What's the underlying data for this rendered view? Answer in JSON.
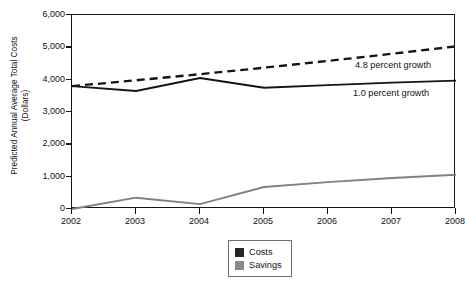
{
  "chart_data": {
    "type": "line",
    "title": "",
    "xlabel": "",
    "ylabel": "Predicted Annual Average Total Costs (Dollars)",
    "ylabel_line1": "Predicted Annual Average Total Costs",
    "ylabel_line2": "(Dollars)",
    "x": [
      2002,
      2003,
      2004,
      2005,
      2006,
      2007,
      2008
    ],
    "categories": [
      "2002",
      "2003",
      "2004",
      "2005",
      "2006",
      "2007",
      "2008"
    ],
    "xlim": [
      2002,
      2008
    ],
    "ylim": [
      0,
      6000
    ],
    "yticks": [
      0,
      1000,
      2000,
      3000,
      4000,
      5000,
      6000
    ],
    "ytick_labels": [
      "0",
      "1,000",
      "2,000",
      "3,000",
      "4,000",
      "5,000",
      "6,000"
    ],
    "grid": false,
    "legend_position": "bottom-center",
    "series": [
      {
        "name": "Costs",
        "style": "solid",
        "color": "#141414",
        "values": [
          3800,
          3650,
          4050,
          3750,
          3830,
          3910,
          3970
        ]
      },
      {
        "name": "Projected costs at 4.8 percent growth",
        "style": "dashed",
        "color": "#141414",
        "values": [
          3800,
          3980,
          4170,
          4370,
          4580,
          4800,
          5030
        ]
      },
      {
        "name": "Savings",
        "style": "solid",
        "color": "#808080",
        "values": [
          0,
          350,
          150,
          680,
          830,
          960,
          1060
        ]
      }
    ],
    "annotations": [
      {
        "text": "4.8 percent growth",
        "x": 2007.1,
        "y": 4420
      },
      {
        "text": "1.0 percent growth",
        "x": 2007.0,
        "y": 3560
      }
    ]
  },
  "annotations": {
    "growth_high": "4.8 percent growth",
    "growth_low": "1.0 percent growth"
  },
  "legend": {
    "items": [
      {
        "label": "Costs",
        "color": "#262626"
      },
      {
        "label": "Savings",
        "color": "#8a8a8a"
      }
    ]
  },
  "colors": {
    "costs": "#141414",
    "savings": "#808080",
    "axis": "#141414",
    "legend_border": "#6e6e6e",
    "background": "#ffffff"
  }
}
